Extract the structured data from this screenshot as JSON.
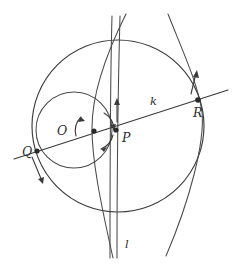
{
  "figure": {
    "kind": "geometry-diagram",
    "background_color": "#ffffff",
    "stroke_color": "#3a3a3a",
    "label_color": "#2e2e2e",
    "labels": [
      {
        "name": "point-q-label",
        "text": "Q",
        "x": 22,
        "y": 156,
        "size": "normal"
      },
      {
        "name": "point-o-label",
        "text": "O",
        "x": 57,
        "y": 135,
        "size": "normal"
      },
      {
        "name": "point-p-label",
        "text": "P",
        "x": 122,
        "y": 142,
        "size": "normal"
      },
      {
        "name": "point-r-label",
        "text": "R",
        "x": 193,
        "y": 117,
        "size": "normal"
      },
      {
        "name": "line-k-label",
        "text": "k",
        "x": 150,
        "y": 105,
        "size": "small"
      },
      {
        "name": "line-l-label",
        "text": "l",
        "x": 125,
        "y": 248,
        "size": "small"
      }
    ],
    "points": [
      {
        "name": "point-q",
        "label": "Q",
        "x": 37,
        "y": 151
      },
      {
        "name": "point-t",
        "label": "",
        "x": 94,
        "y": 131
      },
      {
        "name": "point-p",
        "label": "P",
        "x": 116,
        "y": 130
      },
      {
        "name": "point-r",
        "label": "R",
        "x": 198,
        "y": 100
      }
    ],
    "big_circle": {
      "name": "circle-k",
      "cx": 118,
      "cy": 126,
      "r": 86
    },
    "small_circle": {
      "name": "circle-inner",
      "cx": 74,
      "cy": 130,
      "r": 38
    },
    "arc_arrows": [
      {
        "name": "arc-arrow-upper-right",
        "cx": 94,
        "cy": 131,
        "r": 20,
        "start_deg": 300,
        "end_deg": 355
      },
      {
        "name": "arc-arrow-lower-right",
        "cx": 94,
        "cy": 131,
        "r": 20,
        "start_deg": 10,
        "end_deg": 70
      },
      {
        "name": "arc-arrow-left",
        "cx": 94,
        "cy": 131,
        "r": 20,
        "start_deg": 130,
        "end_deg": 200
      }
    ],
    "straight_arrows": [
      {
        "name": "arrow-up-center",
        "x1": 117,
        "y1": 120,
        "x2": 117,
        "y2": 100,
        "dir": "up"
      },
      {
        "name": "arrow-up-right",
        "x1": 192,
        "y1": 95,
        "x2": 197,
        "y2": 72,
        "dir": "up"
      },
      {
        "name": "arrow-down-left",
        "x1": 33,
        "y1": 157,
        "x2": 43,
        "y2": 184,
        "dir": "down"
      }
    ]
  }
}
